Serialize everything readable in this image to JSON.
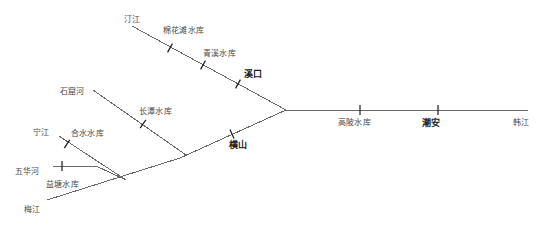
{
  "diagram": {
    "type": "river-network-schematic",
    "background_color": "#ffffff",
    "line_color": "#6b6b6b",
    "tick_color": "#1b1b1b",
    "label_color": "#3a3a3a",
    "station_label_color": "#1b1b1b"
  },
  "labels": {
    "tingjiang": "汀江",
    "mianhuatan": "棉花滩水库",
    "qingxi": "青溪水库",
    "xikou": "溪口",
    "shikuhe": "石窟河",
    "changtan": "长潭水库",
    "ningjiang": "宁江",
    "heshui": "合水水库",
    "wuhuahe": "五华河",
    "yitang": "益塘水库",
    "meijiang": "梅江",
    "hengshan": "横山",
    "gaobei": "高陂水库",
    "chaoan": "潮安",
    "hanjiang": "韩江"
  },
  "nodes": [
    {
      "key": "tingjiang",
      "kind": "river",
      "label": "汀江",
      "x": 124,
      "y": 16
    },
    {
      "key": "mianhuatan",
      "kind": "reservoir",
      "label": "棉花滩水库",
      "x": 163,
      "y": 27
    },
    {
      "key": "qingxi",
      "kind": "reservoir",
      "label": "青溪水库",
      "x": 203,
      "y": 50
    },
    {
      "key": "xikou",
      "kind": "station",
      "label": "溪口",
      "x": 244,
      "y": 70
    },
    {
      "key": "shikuhe",
      "kind": "river",
      "label": "石窟河",
      "x": 60,
      "y": 88
    },
    {
      "key": "changtan",
      "kind": "reservoir",
      "label": "长潭水库",
      "x": 139,
      "y": 108
    },
    {
      "key": "ningjiang",
      "kind": "river",
      "label": "宁江",
      "x": 33,
      "y": 129
    },
    {
      "key": "heshui",
      "kind": "reservoir",
      "label": "合水水库",
      "x": 71,
      "y": 130
    },
    {
      "key": "wuhuahe",
      "kind": "river",
      "label": "五华河",
      "x": 15,
      "y": 168
    },
    {
      "key": "yitang",
      "kind": "reservoir",
      "label": "益塘水库",
      "x": 46,
      "y": 181
    },
    {
      "key": "meijiang",
      "kind": "river",
      "label": "梅江",
      "x": 24,
      "y": 206
    },
    {
      "key": "hengshan",
      "kind": "station",
      "label": "横山",
      "x": 229,
      "y": 141
    },
    {
      "key": "gaobei",
      "kind": "reservoir",
      "label": "高陂水库",
      "x": 338,
      "y": 119
    },
    {
      "key": "chaoan",
      "kind": "station",
      "label": "潮安",
      "x": 422,
      "y": 119
    },
    {
      "key": "hanjiang",
      "kind": "river",
      "label": "韩江",
      "x": 513,
      "y": 119
    }
  ],
  "edges": [
    {
      "name": "tingjiang-to-junction",
      "x1": 132,
      "y1": 26,
      "x2": 286,
      "y2": 110
    },
    {
      "name": "hengshan-to-junction",
      "x1": 286,
      "y1": 110,
      "x2": 180,
      "y2": 158
    },
    {
      "name": "meijiang-trunk",
      "x1": 180,
      "y1": 158,
      "x2": 47,
      "y2": 200
    },
    {
      "name": "shikuhe-branch",
      "x1": 93,
      "y1": 90,
      "x2": 186,
      "y2": 155
    },
    {
      "name": "heshui-branch",
      "x1": 59,
      "y1": 136,
      "x2": 126,
      "y2": 180
    },
    {
      "name": "wuhuahe-branch",
      "x1": 53,
      "y1": 166,
      "x2": 96,
      "y2": 166
    },
    {
      "name": "wuhuahe-to-junction",
      "x1": 96,
      "y1": 166,
      "x2": 126,
      "y2": 180
    },
    {
      "name": "main-stem-hanjiang",
      "x1": 286,
      "y1": 110,
      "x2": 528,
      "y2": 110
    }
  ],
  "ticks": [
    {
      "name": "tick-mianhuatan",
      "x": 170,
      "y": 48,
      "angle": 29
    },
    {
      "name": "tick-qingxi",
      "x": 203,
      "y": 65,
      "angle": 29
    },
    {
      "name": "tick-xikou",
      "x": 238,
      "y": 84,
      "angle": 29
    },
    {
      "name": "tick-changtan",
      "x": 143,
      "y": 124,
      "angle": 35
    },
    {
      "name": "tick-hengshan",
      "x": 232,
      "y": 134,
      "angle": -24
    },
    {
      "name": "tick-heshui",
      "x": 67,
      "y": 144,
      "angle": 33
    },
    {
      "name": "tick-yitang",
      "x": 62,
      "y": 166,
      "angle": 0
    },
    {
      "name": "tick-gaobei",
      "x": 360,
      "y": 110,
      "angle": 0
    },
    {
      "name": "tick-chaoan",
      "x": 438,
      "y": 110,
      "angle": 0
    }
  ]
}
